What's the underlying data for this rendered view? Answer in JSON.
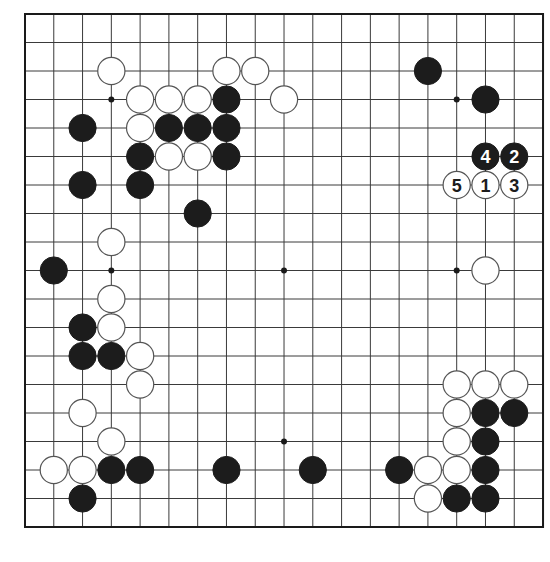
{
  "board": {
    "size": 19,
    "origin_x": 25,
    "origin_y": 14,
    "spacing_x": 28.78,
    "spacing_y": 28.5,
    "stone_radius": 13.6,
    "colors": {
      "line": "#3a3a3a",
      "black": "#1c1c1c",
      "white": "#ffffff",
      "background": "#ffffff"
    },
    "star_points": [
      [
        4,
        4
      ],
      [
        10,
        4
      ],
      [
        16,
        4
      ],
      [
        4,
        10
      ],
      [
        10,
        10
      ],
      [
        16,
        10
      ],
      [
        4,
        16
      ],
      [
        10,
        16
      ],
      [
        16,
        16
      ]
    ],
    "stones": {
      "white": [
        [
          4,
          3
        ],
        [
          8,
          3
        ],
        [
          9,
          3
        ],
        [
          5,
          4
        ],
        [
          6,
          4
        ],
        [
          7,
          4
        ],
        [
          10,
          4
        ],
        [
          5,
          5
        ],
        [
          6,
          6
        ],
        [
          7,
          6
        ],
        [
          4,
          9
        ],
        [
          4,
          11
        ],
        [
          4,
          12
        ],
        [
          5,
          13
        ],
        [
          5,
          14
        ],
        [
          3,
          15
        ],
        [
          4,
          16
        ],
        [
          2,
          17
        ],
        [
          3,
          17
        ],
        [
          17,
          10
        ],
        [
          16,
          14
        ],
        [
          17,
          14
        ],
        [
          18,
          14
        ],
        [
          16,
          15
        ],
        [
          16,
          16
        ],
        [
          15,
          17
        ],
        [
          16,
          17
        ],
        [
          15,
          18
        ]
      ],
      "black": [
        [
          15,
          3
        ],
        [
          8,
          4
        ],
        [
          17,
          4
        ],
        [
          3,
          5
        ],
        [
          6,
          5
        ],
        [
          7,
          5
        ],
        [
          8,
          5
        ],
        [
          5,
          6
        ],
        [
          8,
          6
        ],
        [
          3,
          7
        ],
        [
          5,
          7
        ],
        [
          7,
          8
        ],
        [
          2,
          10
        ],
        [
          3,
          12
        ],
        [
          3,
          13
        ],
        [
          4,
          13
        ],
        [
          4,
          17
        ],
        [
          5,
          17
        ],
        [
          8,
          17
        ],
        [
          11,
          17
        ],
        [
          14,
          17
        ],
        [
          3,
          18
        ],
        [
          17,
          15
        ],
        [
          18,
          15
        ],
        [
          17,
          16
        ],
        [
          17,
          17
        ],
        [
          16,
          18
        ],
        [
          17,
          18
        ]
      ]
    },
    "numbered_moves": [
      {
        "number": "1",
        "color": "white",
        "col": 17,
        "row": 7
      },
      {
        "number": "2",
        "color": "black",
        "col": 18,
        "row": 6
      },
      {
        "number": "3",
        "color": "white",
        "col": 18,
        "row": 7
      },
      {
        "number": "4",
        "color": "black",
        "col": 17,
        "row": 6
      },
      {
        "number": "5",
        "color": "white",
        "col": 16,
        "row": 7
      }
    ]
  }
}
